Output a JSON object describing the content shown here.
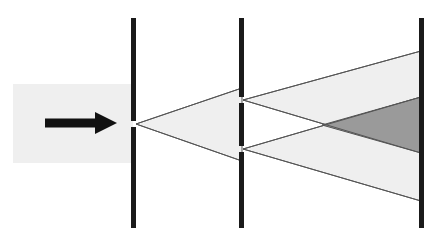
{
  "canvas": {
    "width": 439,
    "height": 241,
    "background": "#ffffff"
  },
  "figure": {
    "name": "double-slit-diffraction-diagram",
    "colors": {
      "beam_light": "#efefef",
      "beam_overlap_dark": "#9a9a9a",
      "barrier_black": "#1a1a1a",
      "outline": "#555555",
      "arrow_black": "#111111",
      "background": "#ffffff"
    }
  },
  "elements": {
    "incoming_beam": {
      "label": "incoming plane wave beam",
      "x": 13,
      "y": 84,
      "width": 120,
      "height": 79,
      "fill": "#efefef"
    },
    "direction_arrow": {
      "label": "propagation direction arrow",
      "from_x": 45,
      "to_x": 117,
      "y": 123,
      "shaft_thickness": 9,
      "head_width": 22,
      "head_height": 22,
      "fill": "#111111"
    },
    "barrier_one": {
      "label": "first barrier with single slit",
      "x": 131,
      "y": 18,
      "width": 5,
      "height": 210,
      "fill": "#1a1a1a",
      "slits": [
        {
          "label": "single-slit",
          "center_y": 124,
          "gap": 6
        }
      ]
    },
    "barrier_two": {
      "label": "second barrier with double slit",
      "x": 239,
      "y": 18,
      "width": 5,
      "height": 210,
      "fill": "#1a1a1a",
      "slits": [
        {
          "label": "upper-slit",
          "center_y": 100,
          "gap": 6
        },
        {
          "label": "lower-slit",
          "center_y": 149,
          "gap": 6
        }
      ]
    },
    "screen": {
      "label": "detection screen",
      "x": 419,
      "y": 18,
      "width": 5,
      "height": 210,
      "fill": "#1a1a1a"
    },
    "cone_single_slit": {
      "label": "cone of light spreading from the single slit",
      "apex_x": 136,
      "apex_y": 124,
      "end_x": 242,
      "top_y": 88,
      "bottom_y": 161,
      "fill": "#efefef"
    },
    "cone_upper_slit": {
      "label": "cone of light spreading from the upper slit",
      "apex_x": 243,
      "apex_y": 100,
      "end_x": 421,
      "top_y": 51,
      "bottom_y": 153,
      "fill": "#efefef"
    },
    "cone_lower_slit": {
      "label": "cone of light spreading from the lower slit",
      "apex_x": 243,
      "apex_y": 149,
      "end_x": 421,
      "top_y": 97,
      "bottom_y": 201,
      "fill": "#efefef"
    },
    "overlap_region": {
      "label": "dark overlap region where both cones superpose",
      "cross_x": 322,
      "cross_y": 125,
      "end_x": 421,
      "end_top_y": 97,
      "end_bottom_y": 153,
      "fill": "#9a9a9a"
    }
  },
  "chart_data": {
    "type": "diagram",
    "title": "",
    "annotations": []
  }
}
